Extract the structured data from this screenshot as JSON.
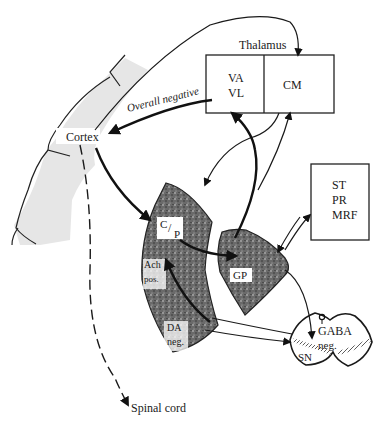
{
  "diagram": {
    "type": "basal ganglia circuit schematic",
    "nodes": {
      "thalamus": {
        "title": "Thalamus",
        "left": "VA",
        "left2": "VL",
        "right": "CM"
      },
      "cortex": {
        "label": "Cortex"
      },
      "caudate_putamen": {
        "c": "C",
        "p": "P"
      },
      "ach": {
        "line1": "Ach",
        "line2": "pos."
      },
      "da": {
        "line1": "DA",
        "line2": "neg."
      },
      "gp": {
        "label": "GP"
      },
      "st_pr_mrf": {
        "line1": "ST",
        "line2": "PR",
        "line3": "MRF"
      },
      "sn": {
        "label": "SN",
        "gaba": "GABA",
        "gaba_sign": "neg."
      },
      "spinal_cord": {
        "label": "Spinal cord"
      }
    },
    "edges": {
      "overall_negative": "Overall negative"
    },
    "colors": {
      "ink": "#1a1a1a",
      "cortex_fill": "#e6e6e6",
      "stipple_dark": "#3a3a3a",
      "background": "#ffffff"
    }
  }
}
